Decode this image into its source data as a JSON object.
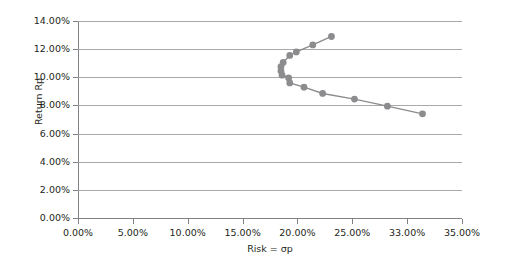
{
  "chart_data": {
    "type": "scatter",
    "title": "",
    "xlabel": "Risk = σp",
    "ylabel": "Return Rp",
    "xlim": [
      0,
      35
    ],
    "ylim": [
      0,
      14
    ],
    "grid": true,
    "legend": false,
    "x_unit": "%",
    "y_unit": "%",
    "x_ticks": [
      {
        "value": 0,
        "label": "0.00%"
      },
      {
        "value": 5,
        "label": "5.00%"
      },
      {
        "value": 10,
        "label": "10.00%"
      },
      {
        "value": 15,
        "label": "15.00%"
      },
      {
        "value": 20,
        "label": "20.00%"
      },
      {
        "value": 25,
        "label": "25.00%"
      },
      {
        "value": 30,
        "label": "33.00%"
      },
      {
        "value": 35,
        "label": "35.00%"
      }
    ],
    "y_ticks": [
      {
        "value": 0,
        "label": "0.00%"
      },
      {
        "value": 2,
        "label": "2.00%"
      },
      {
        "value": 4,
        "label": "4.00%"
      },
      {
        "value": 6,
        "label": "6.00%"
      },
      {
        "value": 8,
        "label": "8.00%"
      },
      {
        "value": 10,
        "label": "10.00%"
      },
      {
        "value": 12,
        "label": "12.00%"
      },
      {
        "value": 14,
        "label": "14.00%"
      }
    ],
    "series": [
      {
        "name": "Efficient frontier",
        "marker": "circle",
        "color": "#8c8c8e",
        "line_color": "#8c8c8e",
        "points": [
          {
            "x": 23.1,
            "y": 12.9
          },
          {
            "x": 21.4,
            "y": 12.3
          },
          {
            "x": 19.9,
            "y": 11.8
          },
          {
            "x": 19.3,
            "y": 11.55
          },
          {
            "x": 18.7,
            "y": 11.05
          },
          {
            "x": 18.5,
            "y": 10.75
          },
          {
            "x": 18.5,
            "y": 10.45
          },
          {
            "x": 18.6,
            "y": 10.15
          },
          {
            "x": 19.2,
            "y": 9.95
          },
          {
            "x": 19.3,
            "y": 9.6
          },
          {
            "x": 20.6,
            "y": 9.3
          },
          {
            "x": 22.3,
            "y": 8.85
          },
          {
            "x": 25.2,
            "y": 8.45
          },
          {
            "x": 28.2,
            "y": 7.95
          },
          {
            "x": 31.4,
            "y": 7.4
          }
        ]
      }
    ]
  },
  "style": {
    "grid_color": "#a7a9ac",
    "axis_color": "#808285",
    "text_color": "#231f20",
    "background": "#ffffff"
  }
}
